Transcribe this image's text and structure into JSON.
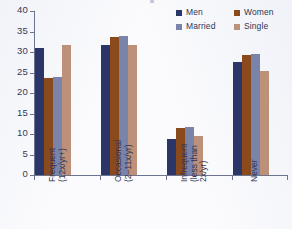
{
  "chart_data": {
    "type": "bar",
    "title": "",
    "xlabel": "",
    "ylabel": "",
    "ylim": [
      0,
      40
    ],
    "yticks": [
      0,
      5,
      10,
      15,
      20,
      25,
      30,
      35,
      40
    ],
    "ytick_labels": [
      "0",
      "5",
      "10",
      "15",
      "20",
      "25",
      "30",
      "35",
      "40"
    ],
    "grid": false,
    "legend_position": "top-right",
    "categories": [
      "Frequent (12x/yr+)",
      "Occasional (2–11x/yr)",
      "Infrequent (less than 2x/yr)",
      "Never"
    ],
    "category_lines": [
      [
        "Frequent",
        "(12x/yr+)"
      ],
      [
        "Occasional",
        "(2–11x/yr)"
      ],
      [
        "Infrequent",
        "(less than",
        "2x/yr)"
      ],
      [
        "Never"
      ]
    ],
    "series": [
      {
        "name": "Men",
        "color": "#2b3568",
        "values": [
          31.0,
          31.8,
          8.7,
          27.5
        ]
      },
      {
        "name": "Women",
        "color": "#8b4a1b",
        "values": [
          23.7,
          33.7,
          11.5,
          29.3
        ]
      },
      {
        "name": "Married",
        "color": "#7a84ab",
        "values": [
          23.8,
          33.8,
          11.7,
          29.4
        ]
      },
      {
        "name": "Single",
        "color": "#bd9179",
        "values": [
          31.7,
          31.6,
          9.4,
          25.3
        ]
      }
    ]
  },
  "legend": {
    "entries": [
      {
        "label": "Men",
        "color": "#2b3568"
      },
      {
        "label": "Women",
        "color": "#8b4a1b"
      },
      {
        "label": "Married",
        "color": "#7a84ab"
      },
      {
        "label": "Single",
        "color": "#bd9179"
      }
    ]
  }
}
